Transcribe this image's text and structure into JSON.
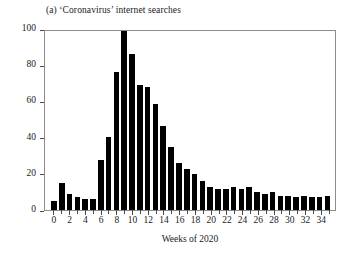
{
  "chart_data": {
    "type": "bar",
    "title": "(a) ‘Coronavirus’ internet searches",
    "xlabel": "Weeks of 2020",
    "ylabel": "Intensity of internet searches per week",
    "xlim": [
      -0.5,
      35.5
    ],
    "ylim": [
      0,
      100
    ],
    "grid": false,
    "legend": null,
    "bar_color": "#000000",
    "frame_color": "#8d8d8d",
    "categories": [
      0,
      1,
      2,
      3,
      4,
      5,
      6,
      7,
      8,
      9,
      10,
      11,
      12,
      13,
      14,
      15,
      16,
      17,
      18,
      19,
      20,
      21,
      22,
      23,
      24,
      25,
      26,
      27,
      28,
      29,
      30,
      31,
      32,
      33,
      34,
      35
    ],
    "values": [
      5,
      15,
      9,
      7,
      6,
      6,
      28,
      41,
      77,
      100,
      87,
      70,
      69,
      59,
      47,
      35,
      26,
      23,
      20,
      16,
      13,
      12,
      12,
      13,
      12,
      13,
      10,
      9,
      10,
      8,
      8,
      7,
      8,
      7,
      7,
      8
    ],
    "x_ticks": [
      0,
      2,
      4,
      6,
      8,
      10,
      12,
      14,
      16,
      18,
      20,
      22,
      24,
      26,
      28,
      30,
      32,
      34
    ],
    "x_tick_labels": [
      "0",
      "2",
      "4",
      "6",
      "8",
      "10",
      "12",
      "14",
      "16",
      "18",
      "20",
      "22",
      "24",
      "26",
      "28",
      "30",
      "32",
      "34"
    ],
    "y_ticks": [
      0,
      20,
      40,
      60,
      80,
      100
    ],
    "y_tick_labels": [
      "0",
      "20",
      "40",
      "60",
      "80",
      "100"
    ]
  }
}
